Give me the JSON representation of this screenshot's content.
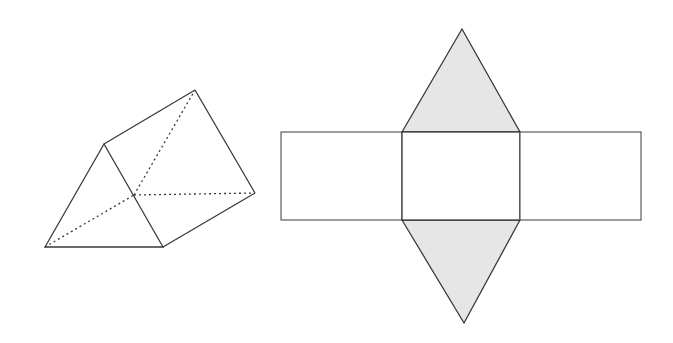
{
  "figure": {
    "colors": {
      "stroke": "#3a3a3a",
      "face_fill": "#ffffff",
      "triangle_fill": "#e6e6e6"
    },
    "prism": {
      "vertices": {
        "front_top": [
          104,
          144
        ],
        "front_bottom_left": [
          45,
          247
        ],
        "front_bottom_right": [
          163,
          247
        ],
        "back_top": [
          195,
          90
        ],
        "back_bottom_right": [
          255,
          193
        ],
        "back_bottom_left_hidden": [
          134,
          195
        ]
      }
    },
    "net": {
      "rect": {
        "x": 281,
        "y": 132,
        "width": 360,
        "height": 88
      },
      "divider_x": [
        402,
        520
      ],
      "top_triangle_apex": [
        462,
        29
      ],
      "bottom_triangle_apex": [
        464,
        323
      ]
    }
  }
}
